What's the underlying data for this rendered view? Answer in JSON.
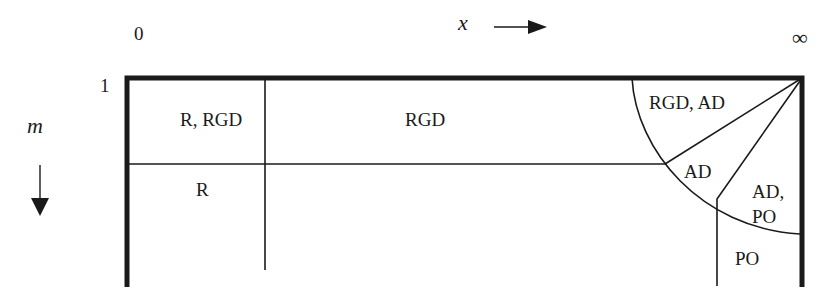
{
  "axes": {
    "x_start_label": "0",
    "x_var_label": "x",
    "x_end_label": "∞",
    "m_top_label": "1",
    "m_var_label": "m",
    "x_arrow_icon": "arrow-right-icon",
    "m_arrow_icon": "arrow-down-icon"
  },
  "regions": [
    {
      "id": "r-rgd",
      "label": "R, RGD"
    },
    {
      "id": "rgd",
      "label": "RGD"
    },
    {
      "id": "r",
      "label": "R"
    },
    {
      "id": "rgd-ad",
      "label": "RGD, AD"
    },
    {
      "id": "ad",
      "label": "AD"
    },
    {
      "id": "ad-po-line1",
      "label": "AD,"
    },
    {
      "id": "ad-po-line2",
      "label": "PO"
    },
    {
      "id": "po",
      "label": "PO"
    }
  ],
  "colors": {
    "ink": "#1a1a1a",
    "background": "#ffffff"
  }
}
